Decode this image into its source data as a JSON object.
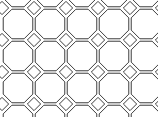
{
  "figure": {
    "width": 158,
    "height": 117,
    "background_color": "#ffffff",
    "stroke_color": "#3c3c3c",
    "stroke_width": 1,
    "fill_color": "none"
  },
  "geometry": {
    "cell_size": 32,
    "octagon_radius": 16,
    "octagon_cut": 4.686,
    "square_half_diagonal": 6.627,
    "octagon_origin_x": 18,
    "octagon_origin_y": -8,
    "square_origin_x": 34,
    "square_origin_y": 8,
    "octagon_columns": 5,
    "octagon_rows": 5,
    "square_columns": 5,
    "square_rows": 5
  },
  "chart_data": {
    "type": "diagram",
    "shape_kinds": [
      "octagon",
      "square"
    ],
    "octagon_centers": [
      [
        18,
        -8
      ],
      [
        50,
        -8
      ],
      [
        82,
        -8
      ],
      [
        114,
        -8
      ],
      [
        146,
        -8
      ],
      [
        18,
        24
      ],
      [
        50,
        24
      ],
      [
        82,
        24
      ],
      [
        114,
        24
      ],
      [
        146,
        24
      ],
      [
        18,
        56
      ],
      [
        50,
        56
      ],
      [
        82,
        56
      ],
      [
        114,
        56
      ],
      [
        146,
        56
      ],
      [
        18,
        88
      ],
      [
        50,
        88
      ],
      [
        82,
        88
      ],
      [
        114,
        88
      ],
      [
        146,
        88
      ],
      [
        18,
        120
      ],
      [
        50,
        120
      ],
      [
        82,
        120
      ],
      [
        114,
        120
      ],
      [
        146,
        120
      ]
    ],
    "square_centers": [
      [
        34,
        8
      ],
      [
        66,
        8
      ],
      [
        98,
        8
      ],
      [
        130,
        8
      ],
      [
        162,
        8
      ],
      [
        34,
        40
      ],
      [
        66,
        40
      ],
      [
        98,
        40
      ],
      [
        130,
        40
      ],
      [
        162,
        40
      ],
      [
        34,
        72
      ],
      [
        66,
        72
      ],
      [
        98,
        72
      ],
      [
        130,
        72
      ],
      [
        162,
        72
      ],
      [
        34,
        104
      ],
      [
        66,
        104
      ],
      [
        98,
        104
      ],
      [
        130,
        104
      ],
      [
        162,
        104
      ],
      [
        2,
        8
      ],
      [
        2,
        40
      ],
      [
        2,
        72
      ],
      [
        2,
        104
      ]
    ],
    "visible_octagon_count": 15,
    "visible_square_count": 16
  }
}
